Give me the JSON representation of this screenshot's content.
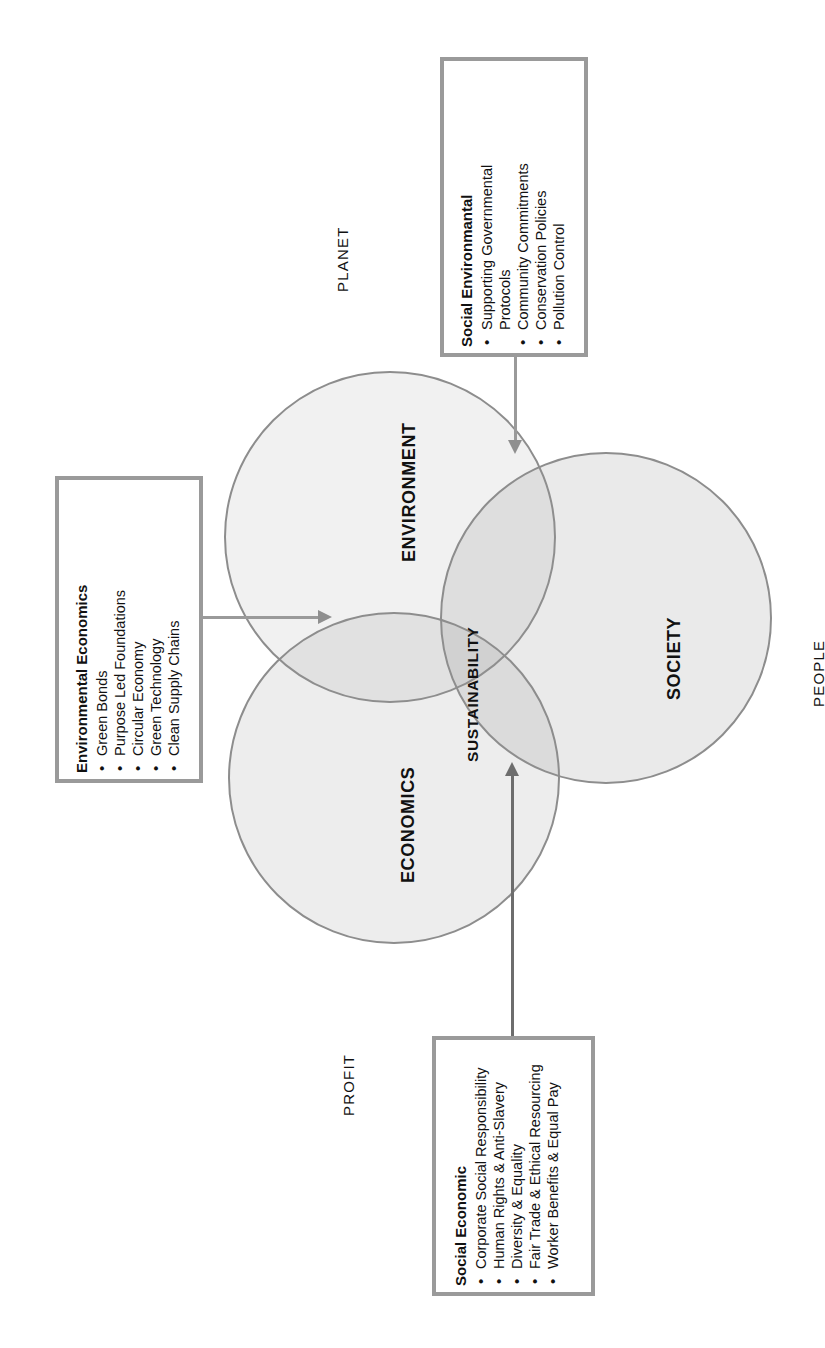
{
  "diagram": {
    "title_present": false,
    "circles": [
      {
        "id": "environment",
        "label": "ENVIRONMENT"
      },
      {
        "id": "society",
        "label": "SOCIETY"
      },
      {
        "id": "economics",
        "label": "ECONOMICS"
      }
    ],
    "center_label": "SUSTAINABILITY",
    "outer_labels": {
      "planet": "PLANET",
      "people": "PEOPLE",
      "profit": "PROFIT"
    },
    "callouts": [
      {
        "id": "social-environmental",
        "title": "Social Environmantal",
        "items": [
          "Supporting Governmental",
          "Protocols",
          "Community Commitments",
          "Conservation Policies",
          "Pollution Control"
        ],
        "bulleted": [
          true,
          false,
          true,
          true,
          true
        ]
      },
      {
        "id": "environmental-economics",
        "title": "Environmental Economics",
        "items": [
          "Green Bonds",
          "Purpose Led Foundations",
          "Circular Economy",
          "Green Technology",
          "Clean Supply Chains"
        ],
        "bulleted": [
          true,
          true,
          true,
          true,
          true
        ]
      },
      {
        "id": "social-economic",
        "title": "Social Economic",
        "items": [
          "Corporate Social Responsibility",
          "Human Rights & Anti-Slavery",
          "Diversity & Equality",
          "Fair Trade & Ethical Resourcing",
          "Worker Benefits & Equal Pay"
        ],
        "bulleted": [
          true,
          true,
          true,
          true,
          true
        ]
      }
    ],
    "colors": {
      "circle_stroke": "#8d8d8d",
      "box_border": "#9a9a9a",
      "connector": "#9a9a9a",
      "connector_dark": "#6d6d6d",
      "text": "#111111",
      "background": "#ffffff"
    }
  }
}
